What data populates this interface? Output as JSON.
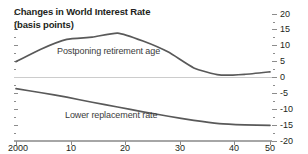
{
  "chart_data": {
    "type": "line",
    "title": "Changes in World Interest Rate",
    "subtitle": "(basis points)",
    "title_line1": "Changes in World Interest Rate",
    "title_line2": "(basis points)",
    "xlabel": "",
    "ylabel": "",
    "unit": "basis points",
    "xlim": [
      2000,
      2050
    ],
    "ylim": [
      -20,
      20
    ],
    "grid": false,
    "legend_position": "inline-annotation",
    "y_axis_position": "right",
    "zero_line": 0,
    "x_tick_labels": [
      "2000",
      "10",
      "20",
      "30",
      "40",
      "50"
    ],
    "x_tick_values": [
      2000,
      2010,
      2020,
      2030,
      2040,
      2050
    ],
    "y_tick_labels": [
      "20",
      "15",
      "10",
      "5",
      "0",
      "-5",
      "-10",
      "-15",
      "-20"
    ],
    "y_tick_values": [
      20,
      15,
      10,
      5,
      0,
      -5,
      -10,
      -15,
      -20
    ],
    "x": [
      2000,
      2005,
      2010,
      2015,
      2020,
      2025,
      2030,
      2035,
      2040,
      2045,
      2050
    ],
    "series": [
      {
        "name": "Postponing retirement age",
        "values": [
          5.0,
          9.0,
          12.0,
          12.7,
          14.0,
          11.5,
          8.0,
          3.0,
          0.8,
          1.0,
          1.8
        ],
        "color": "#595959"
      },
      {
        "name": "Lower replacement rate",
        "values": [
          -3.5,
          -4.8,
          -6.2,
          -7.8,
          -9.3,
          -10.8,
          -12.2,
          -13.5,
          -14.5,
          -14.9,
          -15.1
        ],
        "color": "#595959"
      }
    ],
    "colors": {
      "line": "#595959",
      "axis": "#a6a6a6",
      "zero_line": "#c9c9c9",
      "text": "#231f20"
    }
  },
  "annotations": {
    "postponing_label": "Postponing retirement age",
    "lower_label": "Lower replacement rate"
  }
}
